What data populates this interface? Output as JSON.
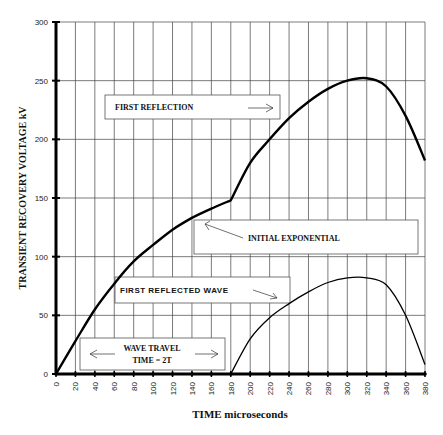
{
  "chart_data": {
    "type": "line",
    "title": "",
    "xlabel": "TIME microseconds",
    "ylabel": "TRANSIENT RECOVERY VOLTAGE  kV",
    "xlim": [
      0,
      380
    ],
    "ylim": [
      0,
      300
    ],
    "grid": true,
    "x_ticks": [
      0,
      20,
      40,
      60,
      80,
      100,
      120,
      140,
      160,
      180,
      200,
      220,
      240,
      260,
      280,
      300,
      320,
      340,
      360,
      380
    ],
    "y_ticks": [
      0,
      50,
      100,
      150,
      200,
      250,
      300
    ],
    "series": [
      {
        "name": "Transient recovery voltage",
        "x": [
          0,
          20,
          40,
          60,
          80,
          100,
          120,
          140,
          160,
          180,
          200,
          220,
          240,
          260,
          280,
          300,
          320,
          340,
          360,
          380
        ],
        "y": [
          0,
          28,
          55,
          77,
          96,
          110,
          123,
          133,
          141,
          148,
          180,
          200,
          218,
          232,
          243,
          250,
          252,
          245,
          220,
          182
        ]
      },
      {
        "name": "First reflected wave",
        "x": [
          180,
          200,
          220,
          240,
          260,
          280,
          300,
          320,
          340,
          360,
          380
        ],
        "y": [
          0,
          30,
          48,
          60,
          70,
          78,
          82,
          82,
          76,
          50,
          8
        ]
      }
    ],
    "annotations": [
      {
        "id": "first_reflection",
        "text": "FIRST REFLECTION",
        "arrow": "right"
      },
      {
        "id": "initial_exponential",
        "text": "INITIAL EXPONENTIAL",
        "arrow": "up-left"
      },
      {
        "id": "first_reflected_wave",
        "text": "FIRST REFLECTED WAVE",
        "arrow": "down-right"
      },
      {
        "id": "wave_travel",
        "text_line1": "WAVE TRAVEL",
        "text_line2": "TIME  =  2T",
        "arrow": "both"
      }
    ]
  },
  "labels": {
    "xlabel": "TIME microseconds",
    "ylabel": "TRANSIENT RECOVERY VOLTAGE  kV",
    "first_reflection": "FIRST REFLECTION",
    "initial_exponential": "INITIAL EXPONENTIAL",
    "first_reflected_wave": "FIRST REFLECTED WAVE",
    "wave_travel_1": "WAVE TRAVEL",
    "wave_travel_2": "TIME  =  2T"
  }
}
